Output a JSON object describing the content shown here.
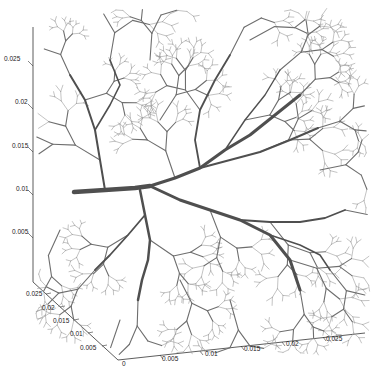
{
  "chart_data": {
    "type": "3d-line",
    "title": "",
    "xlabel": "",
    "ylabel": "",
    "zlabel": "",
    "xlim": [
      0,
      0.028
    ],
    "ylim": [
      0,
      0.028
    ],
    "zlim": [
      0,
      0.028
    ],
    "x_ticks": [
      "0",
      "0.005",
      "0.01",
      "0.015",
      "0.02",
      "0.025"
    ],
    "y_ticks": [
      "0.005",
      "0.01",
      "0.015",
      "0.02",
      "0.025"
    ],
    "z_ticks": [
      "0.005",
      "0.01",
      "0.015",
      "0.02",
      "0.025"
    ],
    "grid": false,
    "legend": null,
    "line_color": "#555555",
    "root": {
      "x": 0,
      "y": 0.014,
      "z": 0.01,
      "note": "thick trunk enters from left face at z≈0.01"
    }
  },
  "axes": {
    "z_labels": [
      {
        "text": "0.025",
        "x": 4,
        "y": 61
      },
      {
        "text": "0.02",
        "x": 15,
        "y": 104
      },
      {
        "text": "0.015",
        "x": 12,
        "y": 148
      },
      {
        "text": "0.01",
        "x": 16,
        "y": 191
      },
      {
        "text": "0.005",
        "x": 12,
        "y": 234
      }
    ],
    "y_labels": [
      {
        "text": "0.025",
        "x": 26,
        "y": 296
      },
      {
        "text": "0.02",
        "x": 42,
        "y": 310
      },
      {
        "text": "0.015",
        "x": 53,
        "y": 323
      },
      {
        "text": "0.01",
        "x": 70,
        "y": 336
      },
      {
        "text": "0.005",
        "x": 80,
        "y": 350
      }
    ],
    "x_labels": [
      {
        "text": "0",
        "x": 122,
        "y": 366
      },
      {
        "text": "0.005",
        "x": 162,
        "y": 361
      },
      {
        "text": "0.01",
        "x": 205,
        "y": 356
      },
      {
        "text": "0.015",
        "x": 244,
        "y": 351
      },
      {
        "text": "0.02",
        "x": 286,
        "y": 346
      },
      {
        "text": "0.025",
        "x": 326,
        "y": 341
      }
    ]
  }
}
